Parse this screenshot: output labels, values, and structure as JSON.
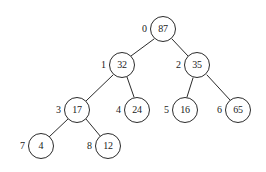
{
  "figure": {
    "background_color": "#ffffff",
    "stroke_color": "#2b2b2b",
    "text_color": "#1a1a1a"
  },
  "chart_data": {
    "type": "diagram",
    "diagram_type": "binary-tree",
    "title": "",
    "node_radius": 13,
    "nodes": [
      {
        "index": "0",
        "value": "87",
        "cx": 163,
        "cy": 29,
        "label_x": 142,
        "label_y": 24,
        "parent": null,
        "side": "root"
      },
      {
        "index": "1",
        "value": "32",
        "cx": 122,
        "cy": 65,
        "label_x": 101,
        "label_y": 60,
        "parent": "0",
        "side": "left"
      },
      {
        "index": "2",
        "value": "35",
        "cx": 197,
        "cy": 65,
        "label_x": 176,
        "label_y": 60,
        "parent": "0",
        "side": "right"
      },
      {
        "index": "3",
        "value": "17",
        "cx": 77,
        "cy": 110,
        "label_x": 56,
        "label_y": 105,
        "parent": "1",
        "side": "left"
      },
      {
        "index": "4",
        "value": "24",
        "cx": 137,
        "cy": 110,
        "label_x": 116,
        "label_y": 105,
        "parent": "1",
        "side": "right"
      },
      {
        "index": "5",
        "value": "16",
        "cx": 185,
        "cy": 110,
        "label_x": 164,
        "label_y": 105,
        "parent": "2",
        "side": "left"
      },
      {
        "index": "6",
        "value": "65",
        "cx": 238,
        "cy": 110,
        "label_x": 217,
        "label_y": 105,
        "parent": "2",
        "side": "right"
      },
      {
        "index": "7",
        "value": "4",
        "cx": 41,
        "cy": 146,
        "label_x": 20,
        "label_y": 141,
        "parent": "3",
        "side": "left"
      },
      {
        "index": "8",
        "value": "12",
        "cx": 108,
        "cy": 146,
        "label_x": 87,
        "label_y": 141,
        "parent": "3",
        "side": "right"
      }
    ],
    "edges": [
      {
        "from": "0",
        "to": "1",
        "x1": 154,
        "y1": 39,
        "x2": 131,
        "y2": 56
      },
      {
        "from": "0",
        "to": "2",
        "x1": 172,
        "y1": 39,
        "x2": 188,
        "y2": 56
      },
      {
        "from": "1",
        "to": "3",
        "x1": 113,
        "y1": 75,
        "x2": 86,
        "y2": 101
      },
      {
        "from": "1",
        "to": "4",
        "x1": 127,
        "y1": 77,
        "x2": 134,
        "y2": 97
      },
      {
        "from": "2",
        "to": "5",
        "x1": 193,
        "y1": 78,
        "x2": 187,
        "y2": 97
      },
      {
        "from": "2",
        "to": "6",
        "x1": 207,
        "y1": 75,
        "x2": 230,
        "y2": 100
      },
      {
        "from": "3",
        "to": "7",
        "x1": 68,
        "y1": 119,
        "x2": 49,
        "y2": 137
      },
      {
        "from": "3",
        "to": "8",
        "x1": 86,
        "y1": 119,
        "x2": 101,
        "y2": 137
      }
    ]
  }
}
